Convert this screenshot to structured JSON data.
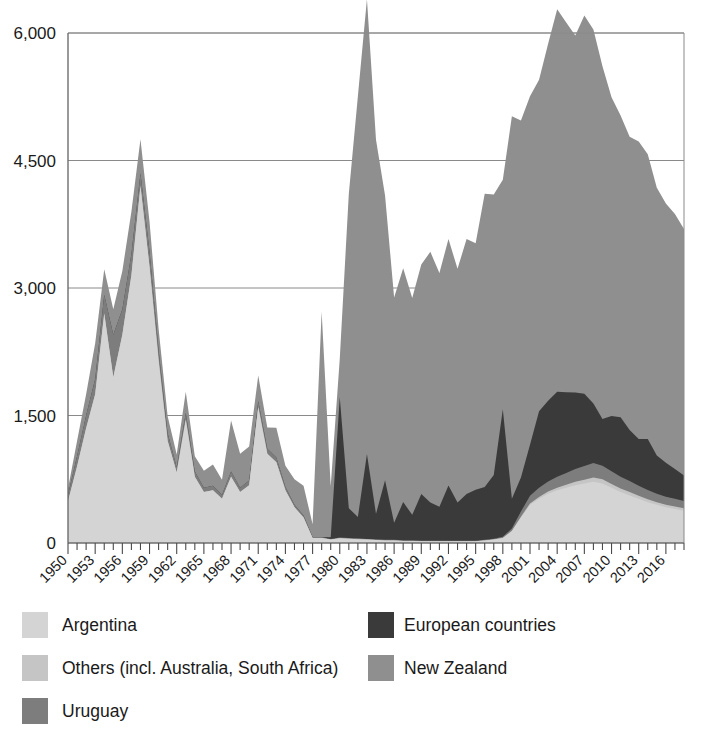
{
  "chart_data": {
    "type": "area",
    "stacked": true,
    "title": "",
    "subtitle": "",
    "xlabel": "",
    "ylabel": "",
    "xlim": [
      1950,
      2018
    ],
    "ylim": [
      0,
      6000
    ],
    "yticks": [
      0,
      1500,
      3000,
      4500,
      6000
    ],
    "ytick_labels": [
      "0",
      "1,500",
      "3,000",
      "4,500",
      "6,000"
    ],
    "grid": true,
    "legend_position": "bottom-left",
    "x": [
      1950,
      1951,
      1952,
      1953,
      1954,
      1955,
      1956,
      1957,
      1958,
      1959,
      1960,
      1961,
      1962,
      1963,
      1964,
      1965,
      1966,
      1967,
      1968,
      1969,
      1970,
      1971,
      1972,
      1973,
      1974,
      1975,
      1976,
      1977,
      1978,
      1979,
      1980,
      1981,
      1982,
      1983,
      1984,
      1985,
      1986,
      1987,
      1988,
      1989,
      1990,
      1991,
      1992,
      1993,
      1994,
      1995,
      1996,
      1997,
      1998,
      1999,
      2000,
      2001,
      2002,
      2003,
      2004,
      2005,
      2006,
      2007,
      2008,
      2009,
      2010,
      2011,
      2012,
      2013,
      2014,
      2015,
      2016,
      2017,
      2018
    ],
    "xtick_labels": [
      "1950",
      "1953",
      "1956",
      "1959",
      "1962",
      "1965",
      "1968",
      "1971",
      "1974",
      "1977",
      "1980",
      "1983",
      "1986",
      "1989",
      "1992",
      "1995",
      "1998",
      "2001",
      "2004",
      "2007",
      "2010",
      "2013",
      "2016"
    ],
    "xtick_values": [
      1950,
      1953,
      1956,
      1959,
      1962,
      1965,
      1968,
      1971,
      1974,
      1977,
      1980,
      1983,
      1986,
      1989,
      1992,
      1995,
      1998,
      2001,
      2004,
      2007,
      2010,
      2013,
      2016
    ],
    "series": [
      {
        "name": "Argentina",
        "color": "#d4d4d4",
        "values": [
          490,
          900,
          1350,
          1750,
          2700,
          1950,
          2450,
          3150,
          4200,
          3250,
          2150,
          1200,
          830,
          1450,
          780,
          600,
          620,
          520,
          780,
          600,
          680,
          1600,
          1050,
          950,
          620,
          420,
          300,
          60,
          60,
          40,
          55,
          50,
          45,
          40,
          35,
          30,
          30,
          25,
          25,
          20,
          20,
          20,
          20,
          20,
          20,
          20,
          30,
          40,
          60,
          140,
          300,
          450,
          520,
          580,
          620,
          650,
          680,
          700,
          720,
          700,
          650,
          600,
          560,
          520,
          480,
          450,
          420,
          400,
          380
        ]
      },
      {
        "name": "Others (incl. Australia, South Africa)",
        "color": "#c5c5c5",
        "values": [
          0,
          0,
          0,
          0,
          0,
          0,
          0,
          0,
          0,
          0,
          0,
          0,
          0,
          0,
          0,
          0,
          0,
          0,
          0,
          0,
          0,
          0,
          0,
          0,
          0,
          0,
          0,
          0,
          0,
          0,
          0,
          0,
          0,
          0,
          0,
          0,
          0,
          0,
          0,
          0,
          0,
          0,
          0,
          0,
          0,
          0,
          0,
          0,
          0,
          0,
          10,
          15,
          20,
          25,
          30,
          35,
          40,
          45,
          50,
          50,
          45,
          40,
          40,
          35,
          35,
          30,
          30,
          30,
          30
        ]
      },
      {
        "name": "Uruguay",
        "color": "#7d7d7d",
        "values": [
          80,
          120,
          150,
          180,
          220,
          500,
          300,
          250,
          150,
          180,
          120,
          90,
          60,
          80,
          60,
          50,
          55,
          45,
          60,
          50,
          55,
          70,
          60,
          55,
          40,
          30,
          25,
          10,
          10,
          8,
          10,
          10,
          10,
          8,
          8,
          8,
          8,
          6,
          6,
          6,
          6,
          6,
          6,
          6,
          6,
          6,
          8,
          10,
          15,
          30,
          60,
          90,
          110,
          120,
          130,
          140,
          150,
          160,
          170,
          160,
          150,
          140,
          130,
          120,
          110,
          100,
          95,
          90,
          85
        ]
      },
      {
        "name": "European countries",
        "color": "#3a3a3a",
        "values": [
          0,
          0,
          0,
          0,
          0,
          0,
          0,
          0,
          0,
          0,
          0,
          0,
          0,
          0,
          0,
          0,
          0,
          0,
          0,
          0,
          0,
          0,
          0,
          0,
          0,
          0,
          0,
          0,
          0,
          20,
          1650,
          350,
          250,
          1000,
          300,
          700,
          200,
          450,
          300,
          550,
          450,
          400,
          650,
          450,
          550,
          600,
          620,
          750,
          1500,
          350,
          400,
          600,
          900,
          950,
          1000,
          950,
          900,
          850,
          700,
          550,
          650,
          700,
          600,
          550,
          600,
          450,
          400,
          350,
          300
        ]
      },
      {
        "name": "New Zealand",
        "color": "#8f8f8f",
        "values": [
          70,
          180,
          250,
          420,
          300,
          300,
          450,
          500,
          400,
          350,
          250,
          200,
          150,
          250,
          180,
          200,
          250,
          180,
          600,
          400,
          400,
          300,
          250,
          350,
          250,
          300,
          350,
          150,
          2650,
          600,
          450,
          3700,
          4950,
          5350,
          4400,
          3350,
          2650,
          2750,
          2550,
          2700,
          2950,
          2750,
          2900,
          2750,
          3000,
          2900,
          3450,
          3300,
          2700,
          4500,
          4200,
          4100,
          3900,
          4200,
          4500,
          4350,
          4200,
          4450,
          4400,
          4150,
          3750,
          3550,
          3450,
          3500,
          3350,
          3150,
          3050,
          3000,
          2900
        ]
      }
    ]
  },
  "legend": {
    "entries": [
      {
        "label": "Argentina",
        "color": "#d4d4d4",
        "column": 0,
        "row": 0
      },
      {
        "label": "Others (incl. Australia, South Africa)",
        "color": "#c5c5c5",
        "column": 0,
        "row": 1
      },
      {
        "label": "Uruguay",
        "color": "#7d7d7d",
        "column": 0,
        "row": 2
      },
      {
        "label": "European countries",
        "color": "#3a3a3a",
        "column": 1,
        "row": 0
      },
      {
        "label": "New Zealand",
        "color": "#8f8f8f",
        "column": 1,
        "row": 1
      }
    ]
  }
}
